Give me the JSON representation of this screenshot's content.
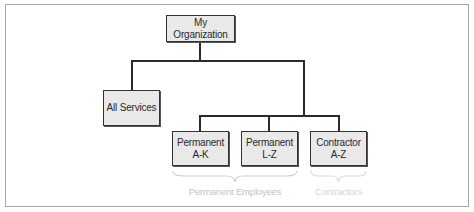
{
  "diagram": {
    "type": "org-chart",
    "root": {
      "label": "My Organization"
    },
    "nodes": [
      {
        "id": "all-services",
        "lines": [
          "All Services"
        ]
      },
      {
        "id": "permanent-a-k",
        "lines": [
          "Permanent",
          "A-K"
        ]
      },
      {
        "id": "permanent-l-z",
        "lines": [
          "Permanent",
          "L-Z"
        ]
      },
      {
        "id": "contractor-a-z",
        "lines": [
          "Contractor",
          "A-Z"
        ]
      }
    ],
    "groups": [
      {
        "label": "Permanent Employees",
        "members": [
          "permanent-a-k",
          "permanent-l-z"
        ]
      },
      {
        "label": "Contractors",
        "members": [
          "contractor-a-z"
        ]
      }
    ]
  },
  "colors": {
    "node_fill": "#e9e9e9",
    "node_border": "#333333",
    "connector": "#2b2b2b",
    "group_label": "#c4c4c4"
  }
}
